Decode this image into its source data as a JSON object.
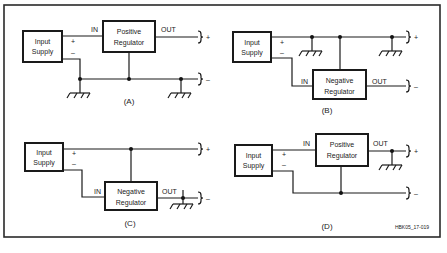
{
  "figure_id": "HBK05_17-019",
  "colors": {
    "line": "#1a1a1a",
    "background": "#ffffff"
  },
  "panels": [
    {
      "label": "(A)",
      "input_supply": {
        "line1": "Input",
        "line2": "Supply"
      },
      "regulator": {
        "line1": "Positive",
        "line2": "Regulator"
      },
      "in_label": "IN",
      "out_label": "OUT",
      "supply_plus": "+",
      "supply_minus": "–",
      "out_plus": "+",
      "out_minus": "–"
    },
    {
      "label": "(B)",
      "input_supply": {
        "line1": "Input",
        "line2": "Supply"
      },
      "regulator": {
        "line1": "Negative",
        "line2": "Regulator"
      },
      "in_label": "IN",
      "out_label": "OUT",
      "supply_plus": "+",
      "supply_minus": "–",
      "out_plus": "+",
      "out_minus": "–"
    },
    {
      "label": "(C)",
      "input_supply": {
        "line1": "Input",
        "line2": "Supply"
      },
      "regulator": {
        "line1": "Negative",
        "line2": "Regulator"
      },
      "in_label": "IN",
      "out_label": "OUT",
      "supply_plus": "+",
      "supply_minus": "–",
      "out_plus": "+",
      "out_minus": "–"
    },
    {
      "label": "(D)",
      "input_supply": {
        "line1": "Input",
        "line2": "Supply"
      },
      "regulator": {
        "line1": "Positive",
        "line2": "Regulator"
      },
      "in_label": "IN",
      "out_label": "OUT",
      "supply_plus": "+",
      "supply_minus": "–",
      "out_plus": "+",
      "out_minus": "–"
    }
  ]
}
